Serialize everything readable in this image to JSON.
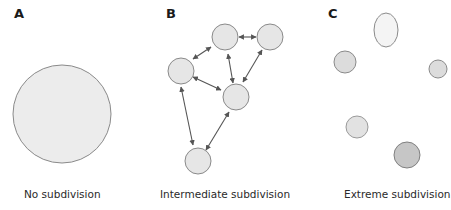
{
  "panels": [
    {
      "label": "A",
      "caption": "No subdivision"
    },
    {
      "label": "B",
      "caption": "Intermediate subdivision"
    },
    {
      "label": "C",
      "caption": "Extreme subdivision"
    }
  ],
  "colors": {
    "fill_light": "#ececec",
    "fill_lighter": "#f4f4f4",
    "fill_mid": "#dadada",
    "fill_dark": "#c4c4c4",
    "stroke": "#8a8a8a",
    "arrow": "#555555"
  }
}
